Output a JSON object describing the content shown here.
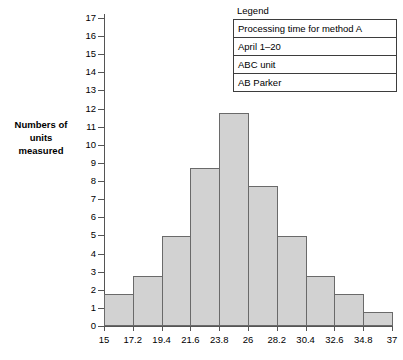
{
  "chart_data": {
    "type": "bar",
    "title": "",
    "subtitle": "",
    "xlabel": "",
    "ylabel": "Numbers of units measured",
    "ylabel_lines": [
      "Numbers of",
      "units",
      "measured"
    ],
    "bin_edges": [
      "15",
      "17.2",
      "19.4",
      "21.6",
      "23.8",
      "26",
      "28.2",
      "30.4",
      "32.6",
      "34.8",
      "37"
    ],
    "categories": [
      "15-17.2",
      "17.2-19.4",
      "19.4-21.6",
      "21.6-23.8",
      "23.8-26",
      "26-28.2",
      "28.2-30.4",
      "30.4-32.6",
      "32.6-34.8",
      "34.8-37"
    ],
    "values": [
      1.75,
      2.75,
      4.95,
      8.7,
      11.75,
      7.75,
      4.95,
      2.75,
      1.75,
      0.75
    ],
    "xlim": [
      15,
      37
    ],
    "bin_width": 2.2,
    "ylim": [
      0,
      17
    ],
    "y_ticks": [
      "0",
      "1",
      "2",
      "3",
      "4",
      "5",
      "6",
      "7",
      "8",
      "9",
      "10",
      "11",
      "12",
      "13",
      "14",
      "15",
      "16",
      "17"
    ],
    "grid": false,
    "legend_position": "top-right",
    "bar_fill_color": "#d2d2d2",
    "bar_border_color": "#6a6a6a",
    "axis_color": "#555555"
  },
  "legend": {
    "title": "Legend",
    "rows": [
      "Processing time for method A",
      "April 1–20",
      "ABC unit",
      "AB Parker"
    ]
  }
}
